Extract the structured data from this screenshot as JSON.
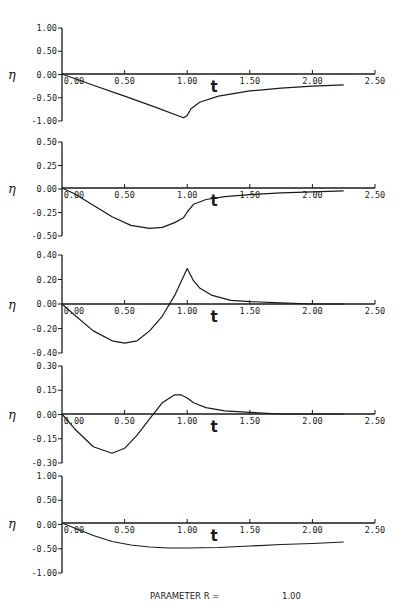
{
  "chart_data": {
    "type": "line",
    "xlabel": "t",
    "ylabel": "η",
    "x_ticks": [
      "0.00",
      "0.50",
      "1.00",
      "1.50",
      "2.00",
      "2.50"
    ],
    "xlim": [
      0,
      2.5
    ],
    "footer": {
      "label": "PARAMETER R =",
      "value": "1.00"
    },
    "panels": [
      {
        "name": "panel-1",
        "ylim": [
          -1.0,
          1.0
        ],
        "y_ticks": [
          "1.00",
          "0.50",
          "0.00",
          "-0.50",
          "-1.00"
        ],
        "series": [
          {
            "x": [
              0.0,
              0.25,
              0.5,
              0.75,
              0.97,
              1.0,
              1.03,
              1.1,
              1.25,
              1.5,
              1.75,
              2.0,
              2.25
            ],
            "y": [
              0.0,
              -0.24,
              -0.47,
              -0.71,
              -0.93,
              -0.88,
              -0.74,
              -0.6,
              -0.47,
              -0.36,
              -0.3,
              -0.26,
              -0.23
            ]
          }
        ]
      },
      {
        "name": "panel-2",
        "ylim": [
          -0.5,
          0.5
        ],
        "y_ticks": [
          "0.50",
          "0.25",
          "0.00",
          "-0.25",
          "-0.50"
        ],
        "series": [
          {
            "x": [
              0.0,
              0.1,
              0.25,
              0.4,
              0.55,
              0.7,
              0.8,
              0.9,
              0.97,
              1.0,
              1.05,
              1.15,
              1.3,
              1.5,
              1.75,
              2.0,
              2.25
            ],
            "y": [
              0.0,
              -0.06,
              -0.18,
              -0.3,
              -0.39,
              -0.42,
              -0.41,
              -0.36,
              -0.31,
              -0.25,
              -0.17,
              -0.12,
              -0.09,
              -0.07,
              -0.05,
              -0.04,
              -0.03
            ]
          }
        ]
      },
      {
        "name": "panel-3",
        "ylim": [
          -0.4,
          0.4
        ],
        "y_ticks": [
          "0.40",
          "0.20",
          "0.00",
          "-0.20",
          "-0.40"
        ],
        "series": [
          {
            "x": [
              0.0,
              0.1,
              0.25,
              0.4,
              0.5,
              0.6,
              0.7,
              0.8,
              0.9,
              1.0,
              1.05,
              1.1,
              1.2,
              1.35,
              1.5,
              1.75,
              2.0,
              2.25
            ],
            "y": [
              0.0,
              -0.09,
              -0.22,
              -0.3,
              -0.32,
              -0.3,
              -0.22,
              -0.1,
              0.07,
              0.29,
              0.19,
              0.13,
              0.07,
              0.03,
              0.02,
              0.01,
              0.0,
              0.0
            ]
          }
        ]
      },
      {
        "name": "panel-4",
        "ylim": [
          -0.3,
          0.3
        ],
        "y_ticks": [
          "0.30",
          "0.15",
          "0.00",
          "-0.15",
          "-0.30"
        ],
        "series": [
          {
            "x": [
              0.0,
              0.1,
              0.25,
              0.4,
              0.5,
              0.6,
              0.7,
              0.8,
              0.9,
              0.95,
              1.0,
              1.05,
              1.15,
              1.3,
              1.5,
              1.75,
              2.0,
              2.25
            ],
            "y": [
              0.0,
              -0.09,
              -0.2,
              -0.24,
              -0.21,
              -0.13,
              -0.03,
              0.07,
              0.12,
              0.12,
              0.1,
              0.07,
              0.04,
              0.02,
              0.01,
              0.0,
              0.0,
              0.0
            ]
          }
        ]
      },
      {
        "name": "panel-5",
        "ylim": [
          -1.0,
          1.0
        ],
        "y_ticks": [
          "1.00",
          "0.50",
          "0.00",
          "-0.50",
          "-1.00"
        ],
        "series": [
          {
            "x": [
              0.0,
              0.1,
              0.25,
              0.4,
              0.55,
              0.7,
              0.85,
              1.0,
              1.25,
              1.5,
              1.75,
              2.0,
              2.25
            ],
            "y": [
              0.0,
              -0.1,
              -0.25,
              -0.37,
              -0.44,
              -0.48,
              -0.5,
              -0.5,
              -0.49,
              -0.46,
              -0.43,
              -0.41,
              -0.38
            ]
          }
        ]
      }
    ]
  },
  "layout": {
    "x0_px": 62,
    "x_px_per_unit": 125.2,
    "x_axis_end_px": 375,
    "panels_px": [
      {
        "y_top": 28,
        "y_zero": 74,
        "y_bottom": 121
      },
      {
        "y_top": 142,
        "y_zero": 188,
        "y_bottom": 236
      },
      {
        "y_top": 255,
        "y_zero": 304,
        "y_bottom": 353
      },
      {
        "y_top": 366,
        "y_zero": 414,
        "y_bottom": 463
      },
      {
        "y_top": 476,
        "y_zero": 523,
        "y_bottom": 573
      }
    ]
  },
  "colors": {
    "ink": "#1a1a1a",
    "background": "#ffffff"
  }
}
